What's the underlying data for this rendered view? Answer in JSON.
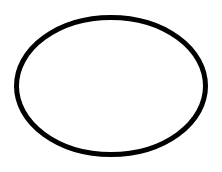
{
  "diagram": {
    "background_color": "#ffffff",
    "shapes": [
      {
        "type": "ellipse",
        "fill": "none",
        "stroke_color": "#000000",
        "stroke_width": 5,
        "cx": 111,
        "cy": 86,
        "rx": 94.5,
        "ry": 68.5
      }
    ]
  }
}
